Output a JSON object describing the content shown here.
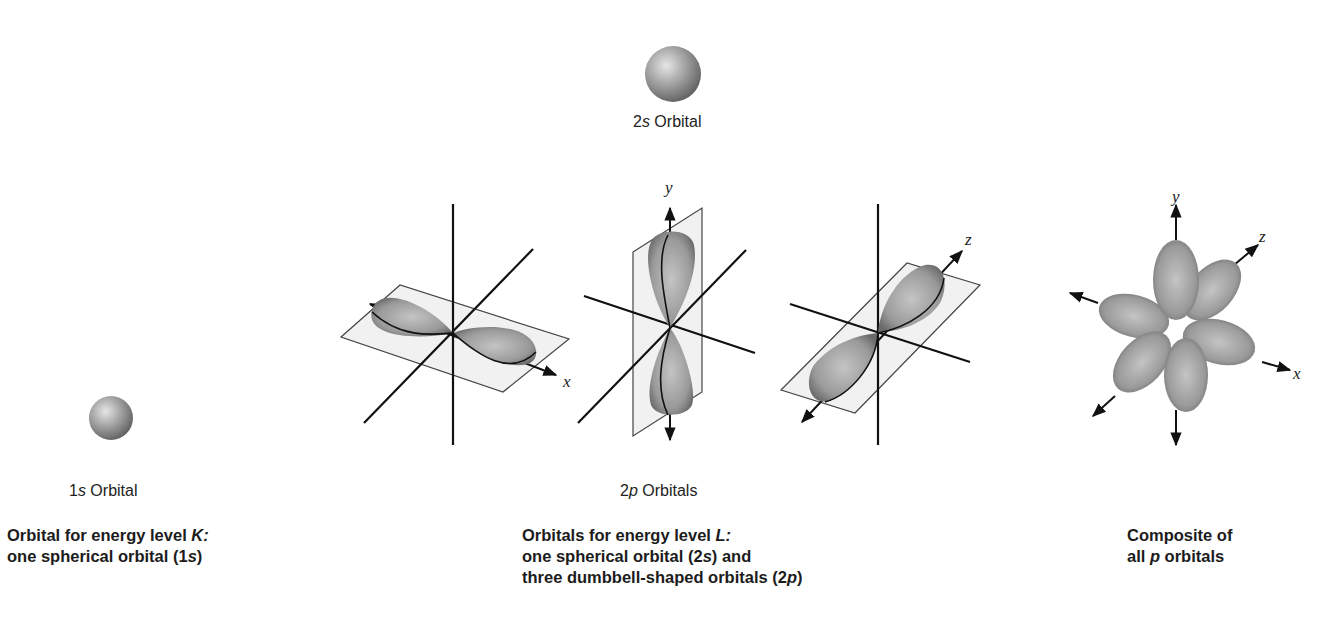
{
  "figure": {
    "colors": {
      "background": "#ffffff",
      "axis_line": "#111111",
      "lobe_fill": "#9a9a9a",
      "plane_fill": "#eeeeee",
      "plane_stroke": "#444444"
    },
    "orbital_1s": {
      "label_num": "1",
      "label_sym": "s",
      "label_word": " Orbital"
    },
    "orbital_2s": {
      "label_num": "2",
      "label_sym": "s",
      "label_word": " Orbital"
    },
    "orbitals_2p": {
      "label_num": "2",
      "label_sym": "p",
      "label_word": " Orbitals",
      "px_axis_label": "x",
      "py_axis_label": "y",
      "pz_axis_label": "z"
    },
    "composite": {
      "axis_y": "y",
      "axis_z": "z",
      "axis_x": "x"
    },
    "captions": {
      "k_level": {
        "line1_pre": "Orbital for energy level ",
        "line1_it": "K:",
        "line2_pre": "one spherical orbital (1",
        "line2_it": "s",
        "line2_post": ")"
      },
      "l_level": {
        "line1_pre": "Orbitals for energy level ",
        "line1_it": "L:",
        "line2_pre": "one spherical orbital (2",
        "line2_it": "s",
        "line2_post": ") and",
        "line3_pre": "three dumbbell-shaped orbitals (2",
        "line3_it": "p",
        "line3_post": ")"
      },
      "composite": {
        "line1": "Composite of",
        "line2_pre": "all ",
        "line2_it": "p",
        "line2_post": " orbitals"
      }
    }
  }
}
